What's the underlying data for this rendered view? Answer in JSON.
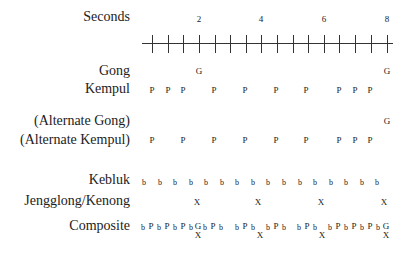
{
  "labels": {
    "seconds": "Seconds",
    "gong": "Gong",
    "kempul": "Kempul",
    "alt_gong": "(Alternate Gong)",
    "alt_kempul": "(Alternate Kempul)",
    "kebluk": "Kebluk",
    "jengglong": "Jengglong/Kenong",
    "composite": "Composite"
  },
  "seconds_ticks": [
    {
      "x": 199,
      "label": "2"
    },
    {
      "x": 261,
      "label": "4"
    },
    {
      "x": 324,
      "label": "6"
    },
    {
      "x": 387,
      "label": "8"
    }
  ],
  "tick_positions": [
    152,
    168,
    183,
    199,
    215,
    230,
    246,
    261,
    277,
    293,
    308,
    324,
    339,
    355,
    371,
    387
  ],
  "rows": {
    "gong": {
      "symbol": "G",
      "positions": [
        199,
        387
      ]
    },
    "kempul": {
      "symbol": "P",
      "positions": [
        152,
        168,
        183,
        214,
        245,
        276,
        306,
        339,
        355,
        370
      ]
    },
    "alt_gong": {
      "symbol": "G",
      "positions": [
        387
      ]
    },
    "alt_kempul": {
      "symbol": "P",
      "positions": [
        152,
        183,
        214,
        245,
        276,
        306,
        339,
        355,
        370
      ]
    },
    "kebluk": {
      "symbol": "b",
      "positions": [
        144,
        160,
        175,
        191,
        206,
        222,
        237,
        253,
        268,
        284,
        300,
        315,
        331,
        346,
        362,
        377
      ]
    },
    "jengglong": {
      "symbol": "X",
      "positions": [
        197,
        258,
        321,
        384
      ]
    }
  },
  "composite": {
    "top": [
      {
        "x": 143,
        "t": "b"
      },
      {
        "x": 151,
        "t": "P"
      },
      {
        "x": 159,
        "t": "b"
      },
      {
        "x": 167,
        "t": "P"
      },
      {
        "x": 175,
        "t": "b"
      },
      {
        "x": 183,
        "t": "P"
      },
      {
        "x": 191,
        "t": "b"
      },
      {
        "x": 198,
        "t": "G"
      },
      {
        "x": 205,
        "t": "b"
      },
      {
        "x": 213,
        "t": "P"
      },
      {
        "x": 221,
        "t": "b"
      },
      {
        "x": 237,
        "t": "b"
      },
      {
        "x": 245,
        "t": "P"
      },
      {
        "x": 253,
        "t": "b"
      },
      {
        "x": 268,
        "t": "b"
      },
      {
        "x": 276,
        "t": "P"
      },
      {
        "x": 284,
        "t": "b"
      },
      {
        "x": 299,
        "t": "b"
      },
      {
        "x": 307,
        "t": "P"
      },
      {
        "x": 315,
        "t": "b"
      },
      {
        "x": 330,
        "t": "b"
      },
      {
        "x": 338,
        "t": "P"
      },
      {
        "x": 346,
        "t": "b"
      },
      {
        "x": 354,
        "t": "P"
      },
      {
        "x": 362,
        "t": "b"
      },
      {
        "x": 370,
        "t": "P"
      },
      {
        "x": 378,
        "t": "b"
      },
      {
        "x": 386,
        "t": "G"
      }
    ],
    "bottom": [
      {
        "x": 198,
        "t": "X"
      },
      {
        "x": 260,
        "t": "X"
      },
      {
        "x": 322,
        "t": "X"
      },
      {
        "x": 386,
        "t": "X"
      }
    ]
  }
}
